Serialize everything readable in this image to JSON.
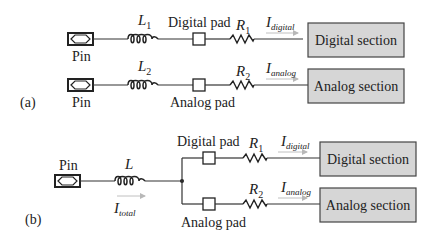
{
  "colors": {
    "wire": "#333333",
    "box_fill": "#d6d6d6",
    "box_stroke": "#444444",
    "arrow": "#b8b8b8",
    "text": "#222222"
  },
  "part_a": {
    "label": "(a)",
    "rows": [
      {
        "pin_label": "Pin",
        "inductor_label": "L",
        "inductor_sub": "1",
        "pad_label": "Digital pad",
        "resistor_label": "R",
        "resistor_sub": "1",
        "current_label": "I",
        "current_sub": "digital",
        "section_label": "Digital section"
      },
      {
        "pin_label": "Pin",
        "inductor_label": "L",
        "inductor_sub": "2",
        "pad_label": "Analog pad",
        "resistor_label": "R",
        "resistor_sub": "2",
        "current_label": "I",
        "current_sub": "analog",
        "section_label": "Analog section"
      }
    ]
  },
  "part_b": {
    "label": "(b)",
    "pin_label": "Pin",
    "inductor_label": "L",
    "total_current_label": "I",
    "total_current_sub": "total",
    "branches": [
      {
        "pad_label": "Digital pad",
        "resistor_label": "R",
        "resistor_sub": "1",
        "current_label": "I",
        "current_sub": "digital",
        "section_label": "Digital section"
      },
      {
        "pad_label": "Analog pad",
        "resistor_label": "R",
        "resistor_sub": "2",
        "current_label": "I",
        "current_sub": "analog",
        "section_label": "Analog section"
      }
    ]
  }
}
